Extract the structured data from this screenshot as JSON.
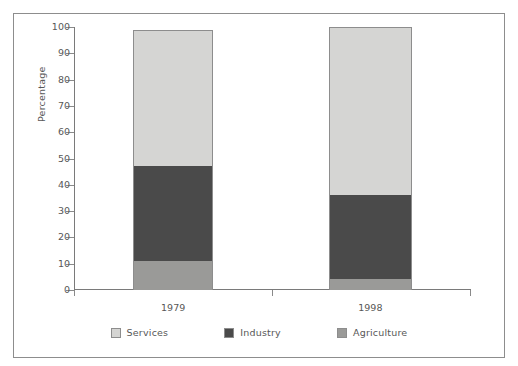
{
  "scan": {
    "top_artifact_text": " "
  },
  "chart_data": {
    "type": "bar",
    "subtype": "stacked-bar-100",
    "title": "",
    "xlabel": "",
    "ylabel": "Percentage",
    "categories": [
      "1979",
      "1998"
    ],
    "ylim": [
      0,
      100
    ],
    "yticks": [
      0,
      10,
      20,
      30,
      40,
      50,
      60,
      70,
      80,
      90,
      100
    ],
    "ytick_labels": [
      "0",
      "10",
      "20",
      "30",
      "40",
      "50",
      "60",
      "70",
      "80",
      "90",
      "100"
    ],
    "grid": false,
    "legend_position": "bottom-center",
    "stack_order_bottom_to_top": [
      "Agriculture",
      "Industry",
      "Services"
    ],
    "series": [
      {
        "name": "Agriculture",
        "color": "#9a9a98",
        "values": [
          11,
          4
        ]
      },
      {
        "name": "Industry",
        "color": "#4a4a4a",
        "values": [
          36,
          32
        ]
      },
      {
        "name": "Services",
        "color": "#d5d5d3",
        "values": [
          52,
          64
        ]
      }
    ],
    "cumulative_tops": {
      "1979": {
        "Agriculture": 11,
        "Industry": 47,
        "Services": 99
      },
      "1998": {
        "Agriculture": 4,
        "Industry": 36,
        "Services": 100
      }
    },
    "annotations": []
  },
  "legend": {
    "items": [
      {
        "label": "Services",
        "color": "#d5d5d3"
      },
      {
        "label": "Industry",
        "color": "#4a4a4a"
      },
      {
        "label": "Agriculture",
        "color": "#9a9a98"
      }
    ]
  }
}
